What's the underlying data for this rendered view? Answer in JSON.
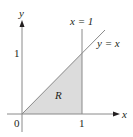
{
  "diagram": {
    "type": "region-plot",
    "axes": {
      "x_label": "x",
      "y_label": "y",
      "origin_label": "0",
      "x_tick_label": "1",
      "y_tick_label": "1"
    },
    "curves": [
      {
        "name": "diagonal",
        "label": "y = x"
      },
      {
        "name": "vertical",
        "label": "x = 1"
      }
    ],
    "region": {
      "label": "R",
      "fill": "#dcdcdc"
    },
    "colors": {
      "axis": "#231f20",
      "curve": "#8a8a8a",
      "fill": "#dcdcdc"
    }
  }
}
